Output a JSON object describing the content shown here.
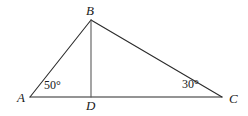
{
  "figure": {
    "name": "triangle-abc-with-altitude-bd",
    "background_color": "#ffffff",
    "stroke_color": "#2b2b2b",
    "text_color": "#1a1a1a",
    "stroke_width": 1
  },
  "vertices": {
    "A": {
      "label": "A",
      "x": 30,
      "y": 97
    },
    "B": {
      "label": "B",
      "x": 91,
      "y": 20
    },
    "C": {
      "label": "C",
      "x": 222,
      "y": 97
    },
    "D": {
      "label": "D",
      "x": 91,
      "y": 97
    }
  },
  "segments": [
    {
      "name": "segment-AB",
      "from": "A",
      "to": "B"
    },
    {
      "name": "segment-BC",
      "from": "B",
      "to": "C"
    },
    {
      "name": "segment-AC",
      "from": "A",
      "to": "C"
    },
    {
      "name": "segment-BD",
      "from": "B",
      "to": "D"
    }
  ],
  "angles": {
    "at_A": {
      "label": "50°",
      "value": 50,
      "unit": "degrees"
    },
    "at_C": {
      "label": "30°",
      "value": 30,
      "unit": "degrees"
    }
  }
}
